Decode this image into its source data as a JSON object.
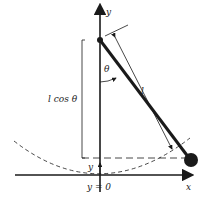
{
  "diagram": {
    "type": "pendulum-geometry",
    "labels": {
      "y_axis": "y",
      "x_axis": "x",
      "angle": "θ",
      "length": "l",
      "vertical_projection": "l cos θ",
      "height": "y",
      "origin_level": "y = 0"
    },
    "colors": {
      "ink": "#1a1a1a",
      "background": "#ffffff"
    }
  }
}
